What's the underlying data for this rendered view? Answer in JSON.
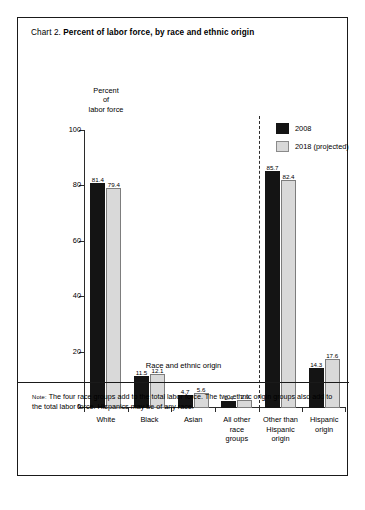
{
  "title": {
    "prefix": "Chart 2.",
    "main": "Percent of labor force, by race and ethnic origin"
  },
  "y_axis_caption": {
    "line1": "Percent",
    "line2": "of",
    "line3": "labor force"
  },
  "legend": {
    "items": [
      {
        "label": "2008",
        "color": "#141414",
        "swatch": "s-2008"
      },
      {
        "label": "2018 (projected)",
        "color": "#d9d9d9",
        "swatch": "s-2018"
      }
    ]
  },
  "x_axis_title": "Race and ethnic origin",
  "note": {
    "label": "Note:",
    "text": " The four race groups add to the total labor force. The two ethnic origin groups also add to the total labor force.  Hispanics may be of any race."
  },
  "y_ticks": [
    "0",
    "20",
    "40",
    "60",
    "80",
    "100"
  ],
  "chart_data": {
    "type": "bar",
    "title": "Chart 2. Percent of labor force, by race and ethnic origin",
    "xlabel": "Race and ethnic origin",
    "ylabel": "Percent of labor force",
    "ylim": [
      0,
      100
    ],
    "yticks": [
      0,
      20,
      40,
      60,
      80,
      100
    ],
    "grid": false,
    "legend_position": "top-right",
    "divider_after_category_index": 3,
    "categories": [
      "White",
      "Black",
      "Asian",
      "All other race groups",
      "Other than Hispanic origin",
      "Hispanic origin"
    ],
    "category_label_lines": [
      [
        "White"
      ],
      [
        "Black"
      ],
      [
        "Asian"
      ],
      [
        "All other",
        "race",
        "groups"
      ],
      [
        "Other than",
        "Hispanic",
        "origin"
      ],
      [
        "Hispanic",
        "origin"
      ]
    ],
    "series": [
      {
        "name": "2008",
        "color": "#141414",
        "values": [
          81.4,
          11.5,
          4.7,
          2.4,
          85.7,
          14.3
        ]
      },
      {
        "name": "2018 (projected)",
        "color": "#d9d9d9",
        "values": [
          79.4,
          12.1,
          5.6,
          2.9,
          82.4,
          17.6
        ]
      }
    ]
  }
}
